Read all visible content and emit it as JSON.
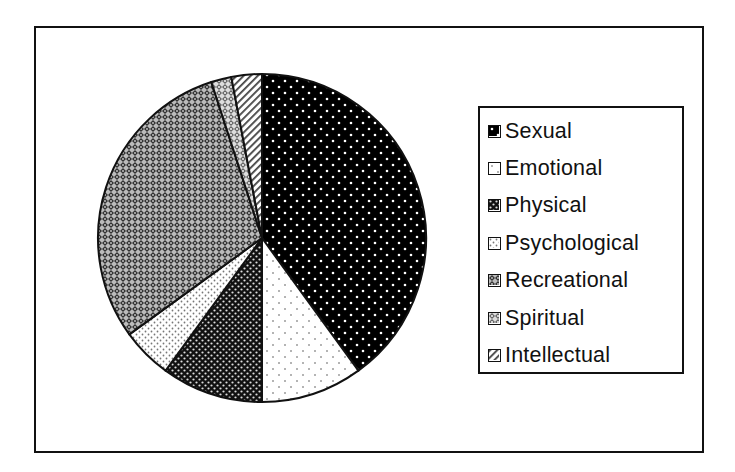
{
  "chart_data": {
    "type": "pie",
    "title": "",
    "categories": [
      "Sexual",
      "Emotional",
      "Physical",
      "Psychological",
      "Recreational",
      "Spiritual",
      "Intellectual"
    ],
    "values": [
      40,
      10,
      10,
      5,
      30,
      2,
      3
    ],
    "unit": "percent (estimated from slice angles)",
    "start_angle": "12 o'clock, clockwise",
    "legend": {
      "position": "right",
      "entries": [
        {
          "label": "Sexual",
          "pattern": "black-with-white-dots"
        },
        {
          "label": "Emotional",
          "pattern": "white-with-sparse-dots"
        },
        {
          "label": "Physical",
          "pattern": "dense-dark-dots"
        },
        {
          "label": "Psychological",
          "pattern": "light-dense-dots"
        },
        {
          "label": "Recreational",
          "pattern": "dark-crosshatch"
        },
        {
          "label": "Spiritual",
          "pattern": "light-crosshatch"
        },
        {
          "label": "Intellectual",
          "pattern": "diagonal-stripes"
        }
      ]
    },
    "colors": {
      "ink": "#111111",
      "background": "#ffffff"
    }
  }
}
